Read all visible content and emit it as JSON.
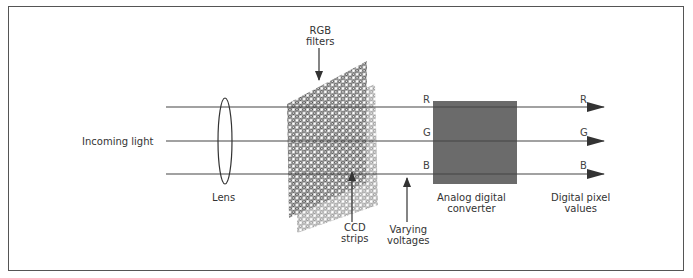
{
  "diagram": {
    "labels": {
      "incoming_light": "Incoming light",
      "lens": "Lens",
      "rgb_filters_line1": "RGB",
      "rgb_filters_line2": "filters",
      "ccd_line1": "CCD",
      "ccd_line2": "strips",
      "voltages_line1": "Varying",
      "voltages_line2": "voltages",
      "adc_line1": "Analog digital",
      "adc_line2": "converter",
      "output_line1": "Digital pixel",
      "output_line2": "values"
    },
    "channels_in": [
      "R",
      "G",
      "B"
    ],
    "channels_out": [
      "R",
      "G",
      "B"
    ],
    "colors": {
      "line": "#444444",
      "converter_fill": "#6b6b6b",
      "filter_mesh": "#4a4a4a",
      "frame": "#555555"
    }
  }
}
